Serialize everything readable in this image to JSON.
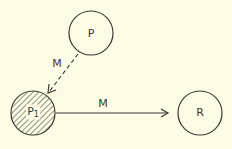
{
  "diagram": {
    "background": "#fcfbe6",
    "stroke_color": "#3a3a32",
    "nodes": [
      {
        "id": "P",
        "label": "P",
        "subscript": "",
        "cx": 91,
        "cy": 33,
        "r": 22,
        "filled": false
      },
      {
        "id": "P1",
        "label": "P",
        "subscript": "1",
        "cx": 33,
        "cy": 113,
        "r": 22,
        "filled": true,
        "fill_style": "hatched"
      },
      {
        "id": "R",
        "label": "R",
        "subscript": "",
        "cx": 200,
        "cy": 113,
        "r": 22,
        "filled": false
      }
    ],
    "edges": [
      {
        "from": "P",
        "to": "P1",
        "label": "M",
        "style": "dashed"
      },
      {
        "from": "P1",
        "to": "R",
        "label": "M",
        "style": "solid"
      }
    ]
  }
}
